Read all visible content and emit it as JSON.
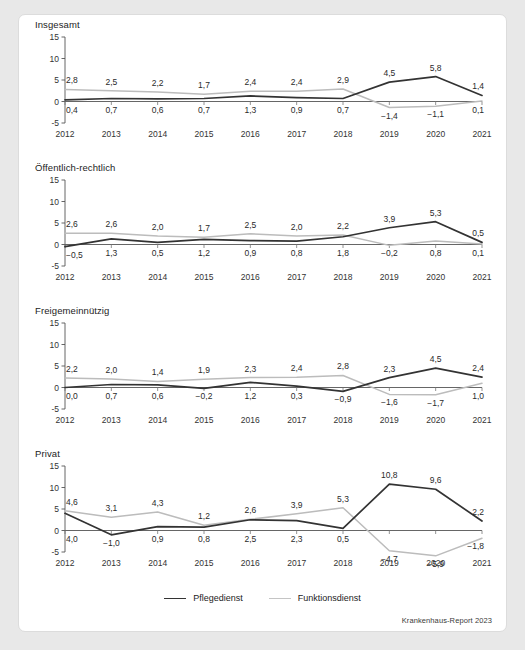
{
  "figure": {
    "source_note": "Krankenhaus-Report 2023",
    "y_ticks": [
      "15",
      "10",
      "5",
      "0",
      "-5"
    ],
    "y_tick_values": [
      15,
      10,
      5,
      0,
      -5
    ],
    "ylim": [
      -5,
      15
    ],
    "categories": [
      "2012",
      "2013",
      "2014",
      "2015",
      "2016",
      "2017",
      "2018",
      "2019",
      "2020",
      "2021"
    ],
    "legend": [
      {
        "label": "Pflegedienst",
        "color": "#333333"
      },
      {
        "label": "Funktionsdienst",
        "color": "#bcbcbc"
      }
    ]
  },
  "chart_data": [
    {
      "type": "line",
      "title": "Insgesamt",
      "xlabel": "",
      "ylabel": "",
      "ylim": [
        -5,
        15
      ],
      "grid": false,
      "legend_position": "bottom",
      "categories": [
        "2012",
        "2013",
        "2014",
        "2015",
        "2016",
        "2017",
        "2018",
        "2019",
        "2020",
        "2021"
      ],
      "series": [
        {
          "name": "Pflegedienst",
          "color": "#333333",
          "values": [
            0.4,
            0.7,
            0.6,
            0.7,
            1.3,
            0.9,
            0.7,
            4.5,
            5.8,
            1.4
          ],
          "labels": [
            "0,4",
            "0,7",
            "0,6",
            "0,7",
            "1,3",
            "0,9",
            "0,7",
            "4,5",
            "5,8",
            "1,4"
          ],
          "label_side": [
            "below",
            "below",
            "below",
            "below",
            "below",
            "below",
            "below",
            "above",
            "above",
            "above"
          ]
        },
        {
          "name": "Funktionsdienst",
          "color": "#bcbcbc",
          "values": [
            2.8,
            2.5,
            2.2,
            1.7,
            2.4,
            2.4,
            2.9,
            -1.4,
            -1.1,
            0.1
          ],
          "labels": [
            "2,8",
            "2,5",
            "2,2",
            "1,7",
            "2,4",
            "2,4",
            "2,9",
            "-1,4",
            "-1,1",
            "0,1"
          ],
          "label_side": [
            "above",
            "above",
            "above",
            "above",
            "above",
            "above",
            "above",
            "below",
            "below",
            "below"
          ]
        }
      ]
    },
    {
      "type": "line",
      "title": "Öffentlich-rechtlich",
      "xlabel": "",
      "ylabel": "",
      "ylim": [
        -5,
        15
      ],
      "grid": false,
      "legend_position": "bottom",
      "categories": [
        "2012",
        "2013",
        "2014",
        "2015",
        "2016",
        "2017",
        "2018",
        "2019",
        "2020",
        "2021"
      ],
      "series": [
        {
          "name": "Pflegedienst",
          "color": "#333333",
          "values": [
            -0.5,
            1.3,
            0.5,
            1.2,
            0.9,
            0.8,
            1.8,
            3.9,
            5.3,
            0.5
          ],
          "labels": [
            "-0,5",
            "1,3",
            "0,5",
            "1,2",
            "0,9",
            "0,8",
            "1,8",
            "3,9",
            "5,3",
            "0,5"
          ],
          "label_side": [
            "below",
            "below",
            "below",
            "below",
            "below",
            "below",
            "below",
            "above",
            "above",
            "above"
          ]
        },
        {
          "name": "Funktionsdienst",
          "color": "#bcbcbc",
          "values": [
            2.6,
            2.6,
            2.0,
            1.7,
            2.5,
            2.0,
            2.2,
            -0.2,
            0.8,
            0.1
          ],
          "labels": [
            "2,6",
            "2,6",
            "2,0",
            "1,7",
            "2,5",
            "2,0",
            "2,2",
            "-0,2",
            "0,8",
            "0,1"
          ],
          "label_side": [
            "above",
            "above",
            "above",
            "above",
            "above",
            "above",
            "above",
            "below",
            "below",
            "below"
          ]
        }
      ]
    },
    {
      "type": "line",
      "title": "Freigemeinnützig",
      "xlabel": "",
      "ylabel": "",
      "ylim": [
        -5,
        15
      ],
      "grid": false,
      "legend_position": "bottom",
      "categories": [
        "2012",
        "2013",
        "2014",
        "2015",
        "2016",
        "2017",
        "2018",
        "2019",
        "2020",
        "2021"
      ],
      "series": [
        {
          "name": "Pflegedienst",
          "color": "#333333",
          "values": [
            0.0,
            0.7,
            0.6,
            -0.2,
            1.2,
            0.3,
            -0.9,
            2.3,
            4.5,
            2.4
          ],
          "labels": [
            "0,0",
            "0,7",
            "0,6",
            "-0,2",
            "1,2",
            "0,3",
            "-0,9",
            "2,3",
            "4,5",
            "2,4"
          ],
          "label_side": [
            "below",
            "below",
            "below",
            "below",
            "below",
            "below",
            "below",
            "above",
            "above",
            "above"
          ]
        },
        {
          "name": "Funktionsdienst",
          "color": "#bcbcbc",
          "values": [
            2.2,
            2.0,
            1.4,
            1.9,
            2.3,
            2.4,
            2.8,
            -1.6,
            -1.7,
            1.0
          ],
          "labels": [
            "2,2",
            "2,0",
            "1,4",
            "1,9",
            "2,3",
            "2,4",
            "2,8",
            "-1,6",
            "-1,7",
            "1,0"
          ],
          "label_side": [
            "above",
            "above",
            "above",
            "above",
            "above",
            "above",
            "above",
            "below",
            "below",
            "below"
          ]
        }
      ]
    },
    {
      "type": "line",
      "title": "Privat",
      "xlabel": "",
      "ylabel": "",
      "ylim": [
        -5,
        15
      ],
      "grid": false,
      "legend_position": "bottom",
      "categories": [
        "2012",
        "2013",
        "2014",
        "2015",
        "2016",
        "2017",
        "2018",
        "2019",
        "2020",
        "2021"
      ],
      "series": [
        {
          "name": "Pflegedienst",
          "color": "#333333",
          "values": [
            4.0,
            -1.0,
            0.9,
            0.8,
            2.5,
            2.3,
            0.5,
            10.8,
            9.6,
            2.2
          ],
          "labels": [
            "4,0",
            "-1,0",
            "0,9",
            "0,8",
            "2,5",
            "2,3",
            "0,5",
            "10,8",
            "9,6",
            "2,2"
          ],
          "label_side": [
            "below",
            "below",
            "below",
            "below",
            "below",
            "below",
            "below",
            "above",
            "above",
            "above"
          ]
        },
        {
          "name": "Funktionsdienst",
          "color": "#bcbcbc",
          "values": [
            4.6,
            3.1,
            4.3,
            1.2,
            2.6,
            3.9,
            5.3,
            -4.7,
            -5.9,
            -1.8
          ],
          "labels": [
            "4,6",
            "3,1",
            "4,3",
            "1,2",
            "2,6",
            "3,9",
            "5,3",
            "-4,7",
            "-5,9",
            "-1,8"
          ],
          "label_side": [
            "above",
            "above",
            "above",
            "above",
            "above",
            "above",
            "above",
            "below",
            "below",
            "below"
          ]
        }
      ]
    }
  ]
}
